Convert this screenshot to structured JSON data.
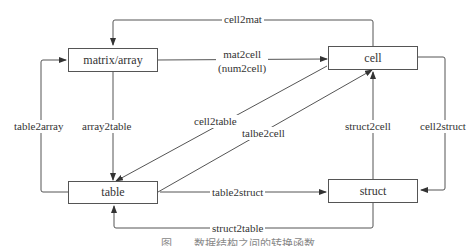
{
  "diagram": {
    "nodes": [
      {
        "id": "matrix",
        "label": "matrix/array"
      },
      {
        "id": "cell",
        "label": "cell"
      },
      {
        "id": "table",
        "label": "table"
      },
      {
        "id": "struct",
        "label": "struct"
      }
    ],
    "edges": [
      {
        "from": "cell",
        "to": "matrix",
        "label": "cell2mat"
      },
      {
        "from": "matrix",
        "to": "cell",
        "label": "mat2cell",
        "label2": "(num2cell)"
      },
      {
        "from": "table",
        "to": "matrix",
        "label": "table2array"
      },
      {
        "from": "matrix",
        "to": "table",
        "label": "array2table"
      },
      {
        "from": "cell",
        "to": "table",
        "label": "cell2table"
      },
      {
        "from": "table",
        "to": "cell",
        "label": "talbe2cell"
      },
      {
        "from": "struct",
        "to": "cell",
        "label": "struct2cell"
      },
      {
        "from": "cell",
        "to": "struct",
        "label": "cell2struct"
      },
      {
        "from": "table",
        "to": "struct",
        "label": "table2struct"
      },
      {
        "from": "struct",
        "to": "table",
        "label": "struct2table"
      }
    ],
    "caption": "图　　数据结构之间的转换函数"
  }
}
